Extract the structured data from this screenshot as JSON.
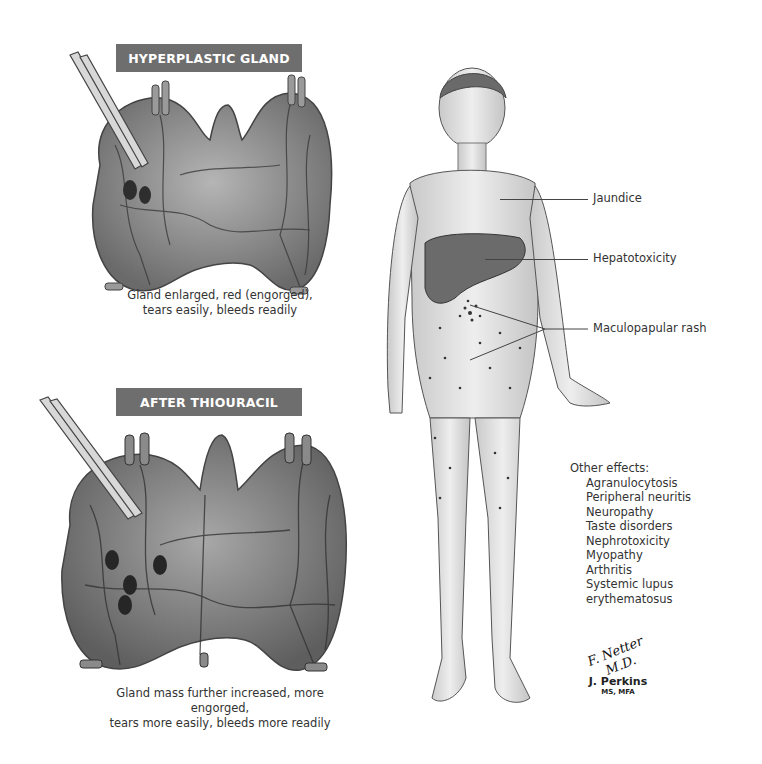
{
  "panels": [
    {
      "title": "HYPERPLASTIC GLAND",
      "caption_lines": [
        "Gland enlarged, red (engorged),",
        "tears easily, bleeds readily"
      ]
    },
    {
      "title": "AFTER THIOURACIL",
      "caption_lines": [
        "Gland mass further increased, more engorged,",
        "tears more easily, bleeds more readily"
      ]
    }
  ],
  "figure": {
    "labels": [
      {
        "text": "Jaundice"
      },
      {
        "text": "Hepatotoxicity"
      },
      {
        "text": "Maculopapular rash"
      }
    ],
    "other_effects": {
      "heading": "Other effects:",
      "items": [
        "Agranulocytosis",
        "Peripheral neuritis",
        "Neuropathy",
        "Taste disorders",
        "Nephrotoxicity",
        "Myopathy",
        "Arthritis",
        "Systemic lupus erythematosus"
      ]
    }
  },
  "signature": {
    "script": "F. Netter M.D.",
    "artist": "J. Perkins",
    "credentials": "MS, MFA"
  },
  "colors": {
    "banner_bg": "#6e6e6e",
    "banner_text": "#ffffff",
    "text": "#333333",
    "gland_fill": "#8a8a8a",
    "liver_fill": "#6b6b6b"
  }
}
